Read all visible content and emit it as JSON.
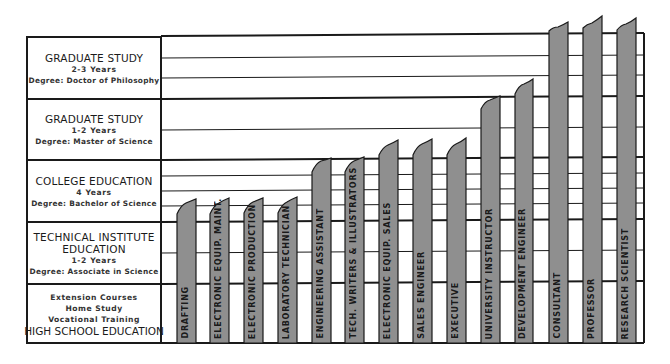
{
  "diagram": {
    "colors": {
      "bar_fill": "#8f8f8f",
      "line": "#1a1a1a",
      "background": "#ffffff"
    },
    "education_levels": [
      {
        "title": "GRADUATE STUDY",
        "duration": "2-3 Years",
        "degree": "Degree: Doctor of Philosophy"
      },
      {
        "title": "GRADUATE STUDY",
        "duration": "1-2 Years",
        "degree": "Degree: Master of Science"
      },
      {
        "title": "COLLEGE EDUCATION",
        "duration": "4 Years",
        "degree": "Degree: Bachelor of Science"
      },
      {
        "title_line1": "TECHNICAL INSTITUTE",
        "title_line2": "EDUCATION",
        "duration": "1-2 Years",
        "degree": "Degree: Associate in Science"
      },
      {
        "line1": "Extension Courses",
        "line2": "Home Study",
        "line3": "Vocational Training",
        "title": "HIGH SCHOOL EDUCATION"
      }
    ],
    "careers": [
      {
        "label": "DRAFTING",
        "level": "Technical Institute (partial)"
      },
      {
        "label": "ELECTRONIC EQUIP. MAINT.",
        "level": "Technical Institute (partial)"
      },
      {
        "label": "ELECTRONIC PRODUCTION",
        "level": "Technical Institute (partial)"
      },
      {
        "label": "LABORATORY TECHNICIAN",
        "level": "Technical Institute (partial)"
      },
      {
        "label": "ENGINEERING ASSISTANT",
        "level": "College (partial)"
      },
      {
        "label": "TECH. WRITERS & ILLUSTRATORS",
        "level": "College (partial)"
      },
      {
        "label": "ELECTRONIC EQUIP. SALES",
        "level": "College"
      },
      {
        "label": "SALES ENGINEER",
        "level": "College"
      },
      {
        "label": "EXECUTIVE",
        "level": "College"
      },
      {
        "label": "UNIVERSITY INSTRUCTOR",
        "level": "Graduate 1-2 (partial)"
      },
      {
        "label": "DEVELOPMENT ENGINEER",
        "level": "Graduate 1-2 (partial)"
      },
      {
        "label": "CONSULTANT",
        "level": "Graduate 2-3"
      },
      {
        "label": "PROFESSOR",
        "level": "Graduate 2-3"
      },
      {
        "label": "RESEARCH SCIENTIST",
        "level": "Graduate 2-3"
      }
    ]
  }
}
